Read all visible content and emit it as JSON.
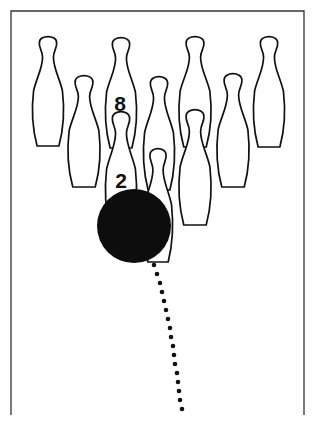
{
  "figure": {
    "colors": {
      "ink": "#111111",
      "background": "#ffffff",
      "ball": "#0d0d0d"
    },
    "lane": {
      "left": 11,
      "right": 304,
      "top": 11,
      "bottom": 415
    },
    "pins": [
      {
        "id": "pin-7",
        "cx": 48,
        "top": 35,
        "height": 111,
        "width": 32,
        "label": ""
      },
      {
        "id": "pin-8",
        "cx": 121,
        "top": 36,
        "height": 112,
        "width": 32,
        "label": "8"
      },
      {
        "id": "pin-9",
        "cx": 195,
        "top": 35,
        "height": 112,
        "width": 33,
        "label": ""
      },
      {
        "id": "pin-10",
        "cx": 269,
        "top": 35,
        "height": 112,
        "width": 32,
        "label": ""
      },
      {
        "id": "pin-4",
        "cx": 84,
        "top": 74,
        "height": 113,
        "width": 33,
        "label": ""
      },
      {
        "id": "pin-5",
        "cx": 159,
        "top": 75,
        "height": 115,
        "width": 32,
        "label": ""
      },
      {
        "id": "pin-6",
        "cx": 233,
        "top": 72,
        "height": 115,
        "width": 33,
        "label": ""
      },
      {
        "id": "pin-2",
        "cx": 121,
        "top": 110,
        "height": 118,
        "width": 32,
        "label": "2"
      },
      {
        "id": "pin-3",
        "cx": 195,
        "top": 108,
        "height": 117,
        "width": 33,
        "label": ""
      },
      {
        "id": "pin-1",
        "cx": 158,
        "top": 147,
        "height": 115,
        "width": 30,
        "label": ""
      }
    ],
    "pin_labels": {
      "eight": {
        "text": "8",
        "x": 120,
        "y": 111
      },
      "two": {
        "text": "2",
        "x": 121,
        "y": 188
      }
    },
    "ball": {
      "cx": 134,
      "cy": 226,
      "r": 37
    },
    "ball_path_dots": [
      [
        154,
        265
      ],
      [
        157,
        274
      ],
      [
        160,
        283
      ],
      [
        162,
        292
      ],
      [
        164,
        301
      ],
      [
        166,
        310
      ],
      [
        168,
        319
      ],
      [
        170,
        328
      ],
      [
        171,
        337
      ],
      [
        173,
        346
      ],
      [
        174,
        355
      ],
      [
        175,
        364
      ],
      [
        177,
        373
      ],
      [
        178,
        382
      ],
      [
        179,
        391
      ],
      [
        180,
        400
      ],
      [
        182,
        409
      ]
    ]
  }
}
